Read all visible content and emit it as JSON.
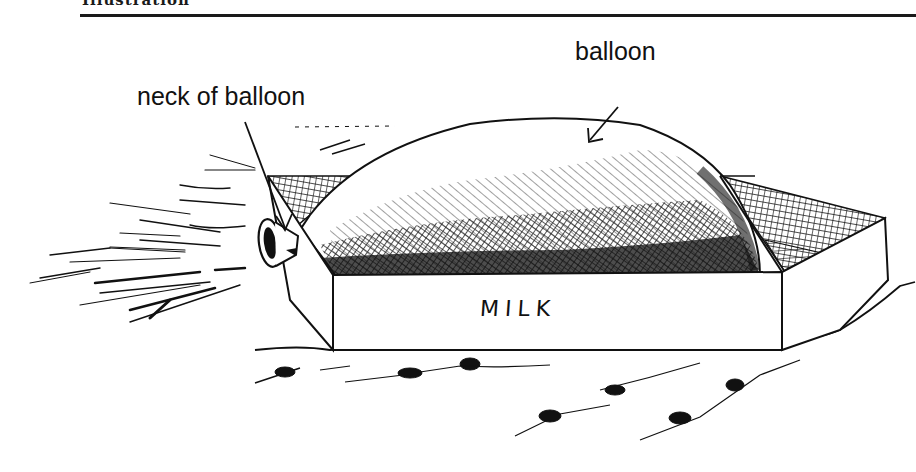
{
  "figure": {
    "header": "Illustration",
    "labels": {
      "neck": "neck of balloon",
      "balloon": "balloon"
    },
    "carton_text": "MILK"
  },
  "colors": {
    "ink": "#111111",
    "paper": "#ffffff"
  }
}
